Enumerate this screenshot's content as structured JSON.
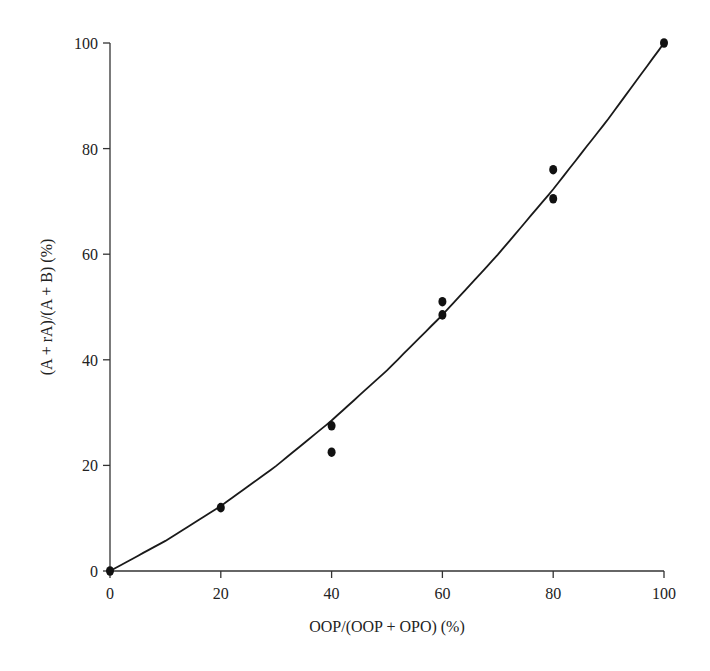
{
  "chart_data": {
    "type": "scatter",
    "title": "",
    "xlabel": "OOP/(OOP + OPO) (%)",
    "ylabel": "(A + rA)/(A + B) (%)",
    "xlim": [
      0,
      100
    ],
    "ylim": [
      0,
      100
    ],
    "xticks": [
      0,
      20,
      40,
      60,
      80,
      100
    ],
    "yticks": [
      0,
      20,
      40,
      60,
      80,
      100
    ],
    "grid": false,
    "legend": null,
    "series": [
      {
        "name": "measured",
        "kind": "points",
        "x": [
          0,
          20,
          40,
          40,
          60,
          60,
          80,
          80,
          100
        ],
        "y": [
          0,
          12,
          27.5,
          22.5,
          51,
          48.5,
          76,
          70.5,
          100
        ]
      },
      {
        "name": "fitted curve",
        "kind": "line",
        "x": [
          0,
          10,
          20,
          30,
          40,
          50,
          60,
          70,
          80,
          90,
          100
        ],
        "y": [
          0,
          5.7,
          12.3,
          19.9,
          28.5,
          38.0,
          48.5,
          59.9,
          72.3,
          85.7,
          100
        ]
      }
    ]
  },
  "colors": {
    "axis": "#333333",
    "points": "#111111",
    "curve": "#1a1a1a",
    "background": "#ffffff"
  }
}
